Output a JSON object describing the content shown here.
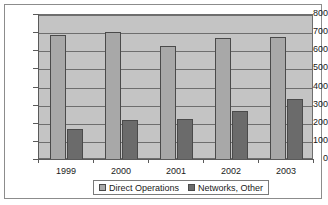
{
  "chart_data": {
    "type": "bar",
    "title": "",
    "subtitle": "",
    "xlabel": "",
    "ylabel": "",
    "categories": [
      "1999",
      "2000",
      "2001",
      "2002",
      "2003"
    ],
    "series": [
      {
        "name": "Direct Operations",
        "color": "#a8a8a8",
        "values": [
          690,
          705,
          628,
          675,
          680
        ]
      },
      {
        "name": "Networks, Other",
        "color": "#6b6b6b",
        "values": [
          170,
          223,
          228,
          273,
          335
        ]
      }
    ],
    "ylim": [
      0,
      800
    ],
    "yticks": [
      0,
      100,
      200,
      300,
      400,
      500,
      600,
      700,
      800
    ],
    "ytick_labels": [
      "0",
      "100",
      "200",
      "300",
      "400",
      "500",
      "600",
      "700",
      "800"
    ],
    "grid": true,
    "grid_axis": "y",
    "legend_position": "bottom",
    "plot_background": "#c4c4c4",
    "figure_background": "#ffffff",
    "border_color": "#8c8c8c"
  }
}
